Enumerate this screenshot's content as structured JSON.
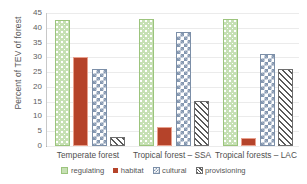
{
  "chart_data": {
    "type": "bar",
    "title": "",
    "xlabel": "",
    "ylabel": "Percent of TEV of forest",
    "ylim": [
      0,
      45
    ],
    "ytick_step": 5,
    "yticks": [
      45,
      40,
      35,
      30,
      25,
      20,
      15,
      10,
      5,
      0
    ],
    "grid": true,
    "legend_position": "bottom",
    "categories": [
      "Temperate forest",
      "Tropical forest – SSA",
      "Tropical forests – LAC"
    ],
    "series": [
      {
        "name": "regulating",
        "values": [
          42.0,
          42.3,
          42.2
        ],
        "color": "#c6e0b4",
        "pattern": "dotted"
      },
      {
        "name": "habitat",
        "values": [
          29.6,
          5.6,
          2.1
        ],
        "color": "#b5432a",
        "pattern": "solid"
      },
      {
        "name": "cultural",
        "values": [
          25.4,
          37.9,
          30.6
        ],
        "color": "#8497b0",
        "pattern": "checkerboard"
      },
      {
        "name": "provisioning",
        "values": [
          2.3,
          14.5,
          25.4
        ],
        "color": "#5a5a5a",
        "pattern": "diagonal-hatch"
      }
    ]
  },
  "legend": {
    "items": [
      {
        "label": "regulating"
      },
      {
        "label": "habitat"
      },
      {
        "label": "cultural"
      },
      {
        "label": "provisioning"
      }
    ]
  }
}
